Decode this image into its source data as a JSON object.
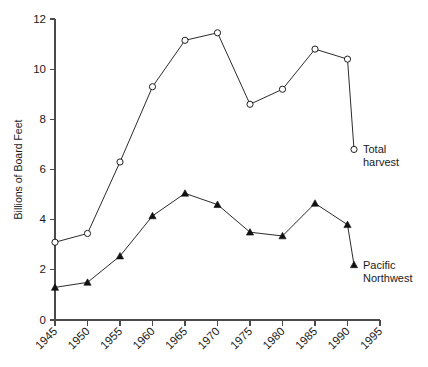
{
  "chart_data": {
    "type": "line",
    "title": "",
    "subtitle": "",
    "xlabel": "",
    "ylabel": "Billions of Board Feet",
    "xlim": [
      1945,
      1995
    ],
    "ylim": [
      0,
      12
    ],
    "grid": false,
    "legend_position": "end-of-line annotations",
    "x_ticks": [
      "1945",
      "1950",
      "1955",
      "1960",
      "1965",
      "1970",
      "1975",
      "1980",
      "1985",
      "1990",
      "1995"
    ],
    "x_tick_values": [
      1945,
      1950,
      1955,
      1960,
      1965,
      1970,
      1975,
      1980,
      1985,
      1990,
      1995
    ],
    "y_ticks": [
      "0",
      "2",
      "4",
      "6",
      "8",
      "10",
      "12"
    ],
    "y_tick_values": [
      0,
      2,
      4,
      6,
      8,
      10,
      12
    ],
    "series": [
      {
        "name": "Total harvest",
        "marker": "open-circle",
        "label_line1": "Total",
        "label_line2": "harvest",
        "color": "#1f1f1f",
        "x": [
          1945,
          1950,
          1955,
          1960,
          1965,
          1970,
          1975,
          1980,
          1985,
          1990,
          1991
        ],
        "values": [
          3.1,
          3.45,
          6.3,
          9.3,
          11.15,
          11.45,
          8.6,
          9.2,
          10.8,
          10.4,
          6.8
        ]
      },
      {
        "name": "Pacific Northwest",
        "marker": "filled-triangle",
        "label_line1": "Pacific",
        "label_line2": "Northwest",
        "color": "#111111",
        "x": [
          1945,
          1950,
          1955,
          1960,
          1965,
          1970,
          1975,
          1980,
          1985,
          1990,
          1991
        ],
        "values": [
          1.3,
          1.5,
          2.55,
          4.15,
          5.05,
          4.6,
          3.5,
          3.35,
          4.65,
          3.8,
          2.2
        ]
      }
    ]
  }
}
